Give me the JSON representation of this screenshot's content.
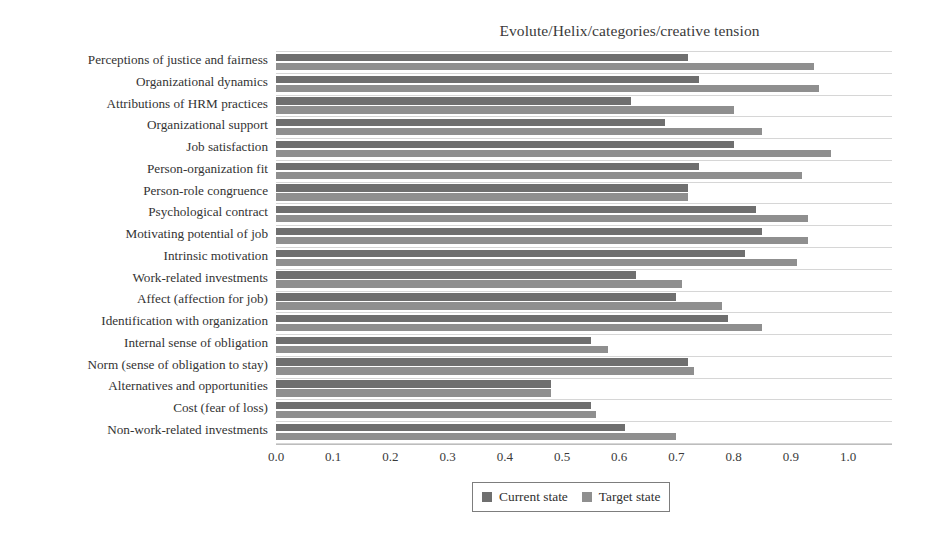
{
  "chart_data": {
    "type": "bar",
    "orientation": "horizontal",
    "title": "Evolute/Helix/categories/creative tension",
    "xlabel": "",
    "ylabel": "",
    "xlim": [
      0.0,
      1.0
    ],
    "xticks": [
      "0.0",
      "0.1",
      "0.2",
      "0.3",
      "0.4",
      "0.5",
      "0.6",
      "0.7",
      "0.8",
      "0.9",
      "1.0"
    ],
    "grid": "horizontal-category-separators",
    "legend_position": "bottom-center",
    "colors": {
      "current_state": "#6f6f6f",
      "target_state": "#8f8f8f",
      "gridline": "#d6d6d6",
      "axis": "#bdbdbd",
      "text": "#333333",
      "background": "#ffffff"
    },
    "categories": [
      "Perceptions of justice and fairness",
      "Organizational dynamics",
      "Attributions of HRM practices",
      "Organizational support",
      "Job satisfaction",
      "Person-organization fit",
      "Person-role congruence",
      "Psychological contract",
      "Motivating potential of job",
      "Intrinsic motivation",
      "Work-related investments",
      "Affect (affection for job)",
      "Identification with organization",
      "Internal sense of obligation",
      "Norm (sense of obligation to stay)",
      "Alternatives and opportunities",
      "Cost (fear of loss)",
      "Non-work-related investments"
    ],
    "series": [
      {
        "name": "Current state",
        "color": "#6f6f6f",
        "values": [
          0.72,
          0.74,
          0.62,
          0.68,
          0.8,
          0.74,
          0.72,
          0.84,
          0.85,
          0.82,
          0.63,
          0.7,
          0.79,
          0.55,
          0.72,
          0.48,
          0.55,
          0.61
        ]
      },
      {
        "name": "Target state",
        "color": "#8f8f8f",
        "values": [
          0.94,
          0.95,
          0.8,
          0.85,
          0.97,
          0.92,
          0.72,
          0.93,
          0.93,
          0.91,
          0.71,
          0.78,
          0.85,
          0.58,
          0.73,
          0.48,
          0.56,
          0.7
        ]
      }
    ]
  },
  "legend": {
    "items": [
      {
        "label": "Current state",
        "icon": "square-swatch-dark"
      },
      {
        "label": "Target state",
        "icon": "square-swatch-light"
      }
    ]
  }
}
